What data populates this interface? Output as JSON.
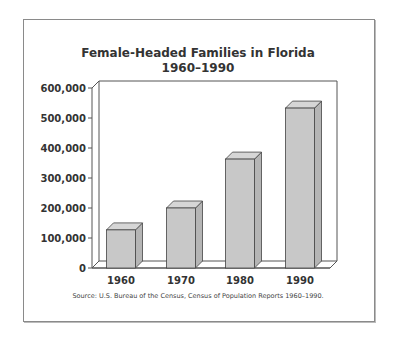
{
  "chart": {
    "title_line1": "Female-Headed Families in Florida",
    "title_line2": "1960–1990",
    "source": "Source: U.S. Bureau of the Census, Census of Population Reports 1960–1990."
  },
  "chart_data": {
    "type": "bar",
    "categories": [
      "1960",
      "1970",
      "1980",
      "1990"
    ],
    "values": [
      127000,
      200000,
      363000,
      533000
    ],
    "xlabel": "",
    "ylabel": "",
    "ylim": [
      0,
      600000
    ],
    "yticks": [
      "0",
      "100,000",
      "200,000",
      "300,000",
      "400,000",
      "500,000",
      "600,000"
    ],
    "grid": false,
    "legend": null,
    "style": "3d",
    "bar_color": "#c8c8c8",
    "annotation": "Source: U.S. Bureau of the Census, Census of Population Reports 1960–1990."
  }
}
